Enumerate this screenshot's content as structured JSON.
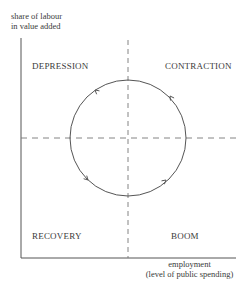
{
  "diagram": {
    "type": "cycle-quadrant",
    "y_axis_label": [
      "share of labour",
      "in value added"
    ],
    "x_axis_label": [
      "employment",
      "(level of public spending)"
    ],
    "quadrants": {
      "top_left": "DEPRESSION",
      "top_right": "CONTRACTION",
      "bottom_left": "RECOVERY",
      "bottom_right": "BOOM"
    },
    "cycle": {
      "shape": "circle",
      "direction": "counter-clockwise",
      "arrows": 4
    },
    "colors": {
      "line": "#555555",
      "text": "#3a3a3a",
      "background": "#ffffff"
    }
  }
}
